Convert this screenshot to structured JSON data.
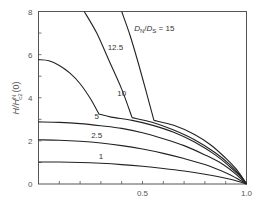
{
  "chart_data": {
    "type": "line",
    "title": "",
    "xlabel": "",
    "ylabel": "H/H^N_c2(0)",
    "ylabel_parts": {
      "main": "H/H",
      "sup": "N",
      "sub": "c2",
      "tail": "(0)"
    },
    "xlim": [
      0,
      1.0
    ],
    "ylim": [
      0,
      8
    ],
    "x_ticks": [
      0,
      0.1,
      0.2,
      0.3,
      0.4,
      0.5,
      0.6,
      0.7,
      0.8,
      0.9,
      1.0
    ],
    "x_tick_labels": [
      {
        "value": 0.5,
        "label": "0.5"
      },
      {
        "value": 1.0,
        "label": "1.0"
      }
    ],
    "y_ticks": [
      0,
      1,
      2,
      3,
      4,
      5,
      6,
      7,
      8
    ],
    "y_tick_labels": [
      {
        "value": 0,
        "label": "0"
      },
      {
        "value": 2,
        "label": "2"
      },
      {
        "value": 4,
        "label": "4"
      },
      {
        "value": 6,
        "label": "6"
      },
      {
        "value": 8,
        "label": "8"
      }
    ],
    "grid": false,
    "legend": "none",
    "series": [
      {
        "name": "1",
        "label": "1",
        "label_at": [
          0.3,
          1.15
        ],
        "points": [
          [
            0,
            1.02
          ],
          [
            0.1,
            1.02
          ],
          [
            0.2,
            1.0
          ],
          [
            0.3,
            0.96
          ],
          [
            0.4,
            0.9
          ],
          [
            0.5,
            0.82
          ],
          [
            0.6,
            0.72
          ],
          [
            0.7,
            0.6
          ],
          [
            0.8,
            0.45
          ],
          [
            0.9,
            0.27
          ],
          [
            0.95,
            0.15
          ],
          [
            1.0,
            0
          ]
        ]
      },
      {
        "name": "2.5",
        "label": "2.5",
        "label_at": [
          0.28,
          2.15
        ],
        "points": [
          [
            0,
            2.05
          ],
          [
            0.1,
            2.03
          ],
          [
            0.2,
            1.98
          ],
          [
            0.3,
            1.9
          ],
          [
            0.4,
            1.78
          ],
          [
            0.5,
            1.62
          ],
          [
            0.6,
            1.42
          ],
          [
            0.7,
            1.18
          ],
          [
            0.8,
            0.9
          ],
          [
            0.9,
            0.52
          ],
          [
            0.95,
            0.28
          ],
          [
            1.0,
            0
          ]
        ]
      },
      {
        "name": "5",
        "label": "5",
        "label_at": [
          0.28,
          3.0
        ],
        "points": [
          [
            0,
            2.88
          ],
          [
            0.1,
            2.86
          ],
          [
            0.2,
            2.8
          ],
          [
            0.3,
            2.7
          ],
          [
            0.4,
            2.58
          ],
          [
            0.5,
            2.38
          ],
          [
            0.6,
            2.1
          ],
          [
            0.7,
            1.78
          ],
          [
            0.8,
            1.35
          ],
          [
            0.88,
            0.95
          ],
          [
            0.95,
            0.45
          ],
          [
            1.0,
            0
          ]
        ]
      },
      {
        "name": "10",
        "label": "10",
        "label_at": [
          0.4,
          4.1
        ],
        "points": [
          [
            0,
            5.77
          ],
          [
            0.05,
            5.72
          ],
          [
            0.1,
            5.5
          ],
          [
            0.15,
            5.15
          ],
          [
            0.2,
            4.65
          ],
          [
            0.25,
            3.95
          ],
          [
            0.29,
            3.25
          ],
          [
            0.35,
            3.1
          ],
          [
            0.45,
            2.95
          ],
          [
            0.55,
            2.72
          ],
          [
            0.65,
            2.4
          ],
          [
            0.75,
            1.95
          ],
          [
            0.85,
            1.35
          ],
          [
            0.92,
            0.8
          ],
          [
            0.97,
            0.35
          ],
          [
            1.0,
            0
          ]
        ]
      },
      {
        "name": "12.5",
        "label": "12.5",
        "label_at": [
          0.37,
          6.2
        ],
        "points": [
          [
            0.22,
            8.0
          ],
          [
            0.28,
            7.0
          ],
          [
            0.34,
            5.7
          ],
          [
            0.4,
            4.4
          ],
          [
            0.45,
            3.08
          ],
          [
            0.55,
            2.85
          ],
          [
            0.65,
            2.5
          ],
          [
            0.75,
            2.05
          ],
          [
            0.85,
            1.45
          ],
          [
            0.92,
            0.9
          ],
          [
            0.97,
            0.4
          ],
          [
            1.0,
            0
          ]
        ]
      },
      {
        "name": "15",
        "label": "D_N/D_S = 15",
        "label_at": [
          0.46,
          7.1
        ],
        "points": [
          [
            0.4,
            8.0
          ],
          [
            0.44,
            6.9
          ],
          [
            0.48,
            5.6
          ],
          [
            0.52,
            4.2
          ],
          [
            0.555,
            2.95
          ],
          [
            0.65,
            2.72
          ],
          [
            0.75,
            2.3
          ],
          [
            0.83,
            1.8
          ],
          [
            0.9,
            1.2
          ],
          [
            0.95,
            0.7
          ],
          [
            0.98,
            0.3
          ],
          [
            1.0,
            0
          ]
        ]
      }
    ],
    "annotation": {
      "d_n": "D",
      "n_sub": "N",
      "slash": "/",
      "d_s": "D",
      "s_sub": "S",
      "eq": " = 15"
    }
  }
}
